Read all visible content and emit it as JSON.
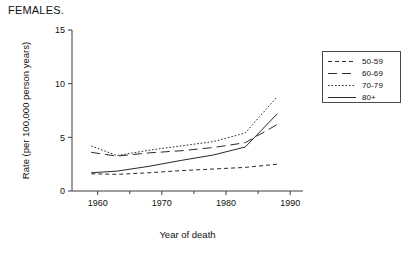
{
  "figure": {
    "title": "FEMALES."
  },
  "chart_data": {
    "type": "line",
    "title": "FEMALES.",
    "xlabel": "Year of death",
    "ylabel": "Rate (per 100,000 person years)",
    "xlim": [
      1956,
      1992
    ],
    "ylim": [
      0,
      15
    ],
    "xticks": [
      1960,
      1970,
      1980,
      1990
    ],
    "xtick_labels": [
      "1960",
      "1970",
      "1980",
      "1990"
    ],
    "xticks_minor": [
      1955,
      1965,
      1975,
      1985
    ],
    "yticks": [
      0,
      5,
      10,
      15
    ],
    "ytick_labels": [
      "0",
      "5",
      "10",
      "15"
    ],
    "grid": false,
    "legend_position": "right-outside",
    "series": [
      {
        "name": "50-59",
        "style": "short-dash",
        "x": [
          1959,
          1963,
          1968,
          1973,
          1978,
          1983,
          1988
        ],
        "values": [
          1.6,
          1.55,
          1.7,
          1.9,
          2.05,
          2.2,
          2.5
        ]
      },
      {
        "name": "60-69",
        "style": "long-dash",
        "x": [
          1959,
          1963,
          1968,
          1973,
          1978,
          1983,
          1988
        ],
        "values": [
          3.6,
          3.25,
          3.55,
          3.75,
          4.05,
          4.5,
          6.2
        ]
      },
      {
        "name": "70-79",
        "style": "dotted",
        "x": [
          1959,
          1963,
          1968,
          1973,
          1978,
          1983,
          1988
        ],
        "values": [
          4.2,
          3.3,
          3.8,
          4.2,
          4.6,
          5.4,
          8.8
        ]
      },
      {
        "name": "80+",
        "style": "solid",
        "x": [
          1959,
          1963,
          1968,
          1973,
          1978,
          1983,
          1988
        ],
        "values": [
          1.7,
          1.85,
          2.3,
          2.85,
          3.35,
          4.1,
          7.2
        ]
      }
    ]
  },
  "legend": {
    "items": [
      {
        "label": "50-59",
        "style": "short-dash"
      },
      {
        "label": "60-69",
        "style": "long-dash"
      },
      {
        "label": "70-79",
        "style": "dotted"
      },
      {
        "label": "80+",
        "style": "solid"
      }
    ]
  },
  "colors": {
    "axis": "#3c3c3c",
    "line": "#2a2a2a",
    "legend_border": "#4a4a4a",
    "text": "#111111"
  }
}
